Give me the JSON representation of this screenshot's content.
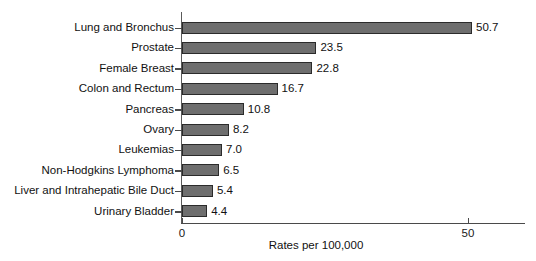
{
  "chart_data": {
    "type": "bar",
    "orientation": "horizontal",
    "title": "",
    "xlabel": "Rates per 100,000",
    "ylabel": "",
    "categories": [
      "Lung and Bronchus",
      "Prostate",
      "Female Breast",
      "Colon and Rectum",
      "Pancreas",
      "Ovary",
      "Leukemias",
      "Non-Hodgkins Lymphoma",
      "Liver and Intrahepatic Bile Duct",
      "Urinary Bladder"
    ],
    "values": [
      50.7,
      23.5,
      22.8,
      16.7,
      10.8,
      8.2,
      7.0,
      6.5,
      5.4,
      4.4
    ],
    "value_labels": [
      "50.7",
      "23.5",
      "22.8",
      "16.7",
      "10.8",
      "8.2",
      "7.0",
      "6.5",
      "5.4",
      "4.4"
    ],
    "xlim": [
      0,
      58
    ],
    "xticks": [
      0,
      50
    ],
    "xtick_labels": [
      "0",
      "50"
    ],
    "grid": false,
    "legend": null,
    "bar_color": "#6e6e6e",
    "bar_edge_color": "#2b2b2b",
    "axis_color": "#4a4a4a",
    "background_color": "#ffffff"
  }
}
